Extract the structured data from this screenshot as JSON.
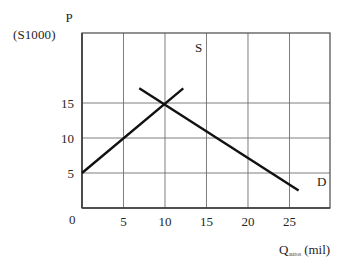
{
  "chart_data": {
    "type": "line",
    "title": "",
    "xlabel": "Q autos (mil)",
    "ylabel": "P (S1000)",
    "xlim": [
      0,
      29.88
    ],
    "ylim": [
      0,
      25
    ],
    "grid": true,
    "legend": "inline-curve-labels",
    "x_ticks": [
      "0",
      "5",
      "10",
      "15",
      "20",
      "25"
    ],
    "x_tick_values": [
      0,
      5,
      10,
      15,
      20,
      25
    ],
    "y_ticks": [
      "5",
      "10",
      "15"
    ],
    "y_tick_values": [
      5,
      10,
      15
    ],
    "equilibrium": {
      "x": 10,
      "y": 15,
      "label": ""
    },
    "series": [
      {
        "name": "S",
        "label": "S",
        "kind": "supply",
        "points": [
          [
            0,
            5
          ],
          [
            12.2,
            17.1
          ]
        ],
        "color": "#111111"
      },
      {
        "name": "D",
        "label": "D",
        "kind": "demand",
        "points": [
          [
            6.9,
            17.1
          ],
          [
            26.1,
            2.5
          ]
        ],
        "color": "#111111"
      }
    ]
  },
  "axes": {
    "y_title": "P",
    "y_units": "(S1000)",
    "x_title_main": "Q",
    "x_title_sub": "autos",
    "x_title_unit": "(mil)",
    "origin": "0"
  },
  "ticks": {
    "y": [
      {
        "label": "15",
        "value": 15
      },
      {
        "label": "10",
        "value": 10
      },
      {
        "label": "5",
        "value": 5
      }
    ],
    "x": [
      {
        "label": "5",
        "value": 5
      },
      {
        "label": "10",
        "value": 10
      },
      {
        "label": "15",
        "value": 15
      },
      {
        "label": "20",
        "value": 20
      },
      {
        "label": "25",
        "value": 25
      }
    ]
  },
  "curves": {
    "supply_label": "S",
    "demand_label": "D"
  },
  "colors": {
    "curve": "#111111",
    "grid": "#6f6f6f",
    "frame": "#4a4a4a",
    "background": "#ffffff",
    "text": "#262626"
  }
}
